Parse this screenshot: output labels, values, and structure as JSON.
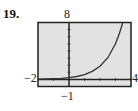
{
  "problem_number": "19.",
  "chart_data": {
    "type": "line",
    "title": "",
    "xlabel": "",
    "ylabel": "",
    "xlim": [
      -2,
      4
    ],
    "ylim": [
      -1,
      8
    ],
    "grid": false,
    "tick_labels": {
      "xmin": "−2",
      "xmax": "4",
      "ymin": "−1",
      "ymax": "8"
    },
    "series": [
      {
        "name": "curve",
        "x": [
          -2,
          -1.5,
          -1,
          -0.5,
          0,
          0.5,
          1,
          1.5,
          2,
          2.5,
          3,
          3.25,
          3.47
        ],
        "y": [
          0.03,
          0.06,
          0.09,
          0.15,
          0.25,
          0.41,
          0.68,
          1.12,
          1.85,
          3.05,
          5.02,
          6.45,
          8.0
        ]
      }
    ],
    "colors": {
      "plot_bg": "#e2e2e2",
      "frame": "#222222",
      "curve": "#333333"
    }
  }
}
